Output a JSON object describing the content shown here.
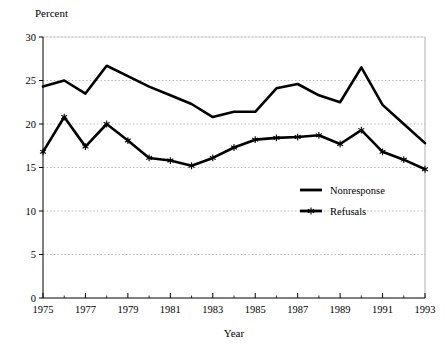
{
  "chart_data": {
    "type": "line",
    "title": "",
    "ylabel": "Percent",
    "xlabel": "Year",
    "x": [
      1975,
      1976,
      1977,
      1978,
      1979,
      1980,
      1981,
      1982,
      1983,
      1984,
      1985,
      1986,
      1987,
      1988,
      1989,
      1990,
      1991,
      1992,
      1993
    ],
    "xlim": [
      1975,
      1993
    ],
    "ylim": [
      0,
      30
    ],
    "yticks": [
      0,
      5,
      10,
      15,
      20,
      25,
      30
    ],
    "ytick_labels": [
      "0",
      "5",
      "10",
      "15",
      "20",
      "25",
      "30"
    ],
    "xticks": [
      1975,
      1977,
      1979,
      1981,
      1983,
      1985,
      1987,
      1989,
      1991,
      1993
    ],
    "xtick_labels": [
      "1975",
      "1977",
      "1979",
      "1981",
      "1983",
      "1985",
      "1987",
      "1989",
      "1991",
      "1993"
    ],
    "xminor_ticks": [
      1976,
      1978,
      1980,
      1982,
      1984,
      1986,
      1988,
      1990,
      1992
    ],
    "grid": "horizontal-dotted",
    "legend_position": "inside-right",
    "series": [
      {
        "name": "Nonresponse",
        "marker": "none",
        "color": "#000000",
        "values": [
          24.3,
          25.0,
          23.5,
          26.7,
          25.5,
          24.3,
          23.3,
          22.3,
          20.8,
          21.4,
          21.4,
          24.1,
          24.6,
          23.3,
          22.5,
          26.5,
          22.2,
          20.0,
          17.8
        ]
      },
      {
        "name": "Refusals",
        "marker": "star",
        "color": "#000000",
        "values": [
          16.8,
          20.8,
          17.4,
          20.0,
          18.1,
          16.1,
          15.8,
          15.2,
          16.1,
          17.3,
          18.2,
          18.4,
          18.5,
          18.7,
          17.7,
          19.3,
          16.8,
          15.9,
          14.8
        ]
      }
    ]
  },
  "legend": {
    "items": [
      {
        "label": "Nonresponse"
      },
      {
        "label": "Refusals"
      }
    ]
  }
}
